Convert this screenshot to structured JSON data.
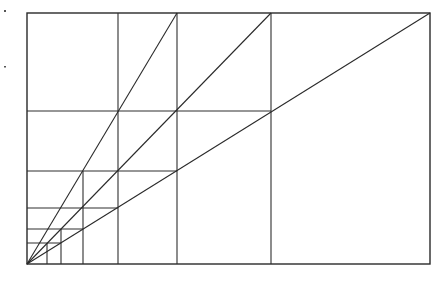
{
  "diagram": {
    "stroke_color": "#2a2a2a",
    "background": "#ffffff",
    "origin": [
      27,
      264
    ],
    "frame": {
      "x1": 27,
      "y1": 13,
      "x2": 430,
      "y2": 264
    },
    "rays": [
      {
        "name": "steep",
        "from": [
          27,
          264
        ],
        "to": [
          177,
          13
        ]
      },
      {
        "name": "middle",
        "from": [
          27,
          264
        ],
        "to": [
          271,
          13
        ]
      },
      {
        "name": "shallow",
        "from": [
          27,
          264
        ],
        "to": [
          430,
          13
        ]
      }
    ],
    "horizontal_lines": [
      {
        "y": 111,
        "x1": 27,
        "x2": 271
      },
      {
        "y": 171,
        "x1": 27,
        "x2": 177
      },
      {
        "y": 208,
        "x1": 27,
        "x2": 118
      },
      {
        "y": 229,
        "x1": 27,
        "x2": 83
      },
      {
        "y": 243,
        "x1": 27,
        "x2": 61
      }
    ],
    "vertical_lines": [
      {
        "x": 47,
        "y1": 243,
        "y2": 264
      },
      {
        "x": 61,
        "y1": 229,
        "y2": 264
      },
      {
        "x": 83,
        "y1": 171,
        "y2": 264
      },
      {
        "x": 118,
        "y1": 13,
        "y2": 264
      },
      {
        "x": 177,
        "y1": 13,
        "y2": 264
      },
      {
        "x": 271,
        "y1": 13,
        "y2": 264
      }
    ]
  }
}
